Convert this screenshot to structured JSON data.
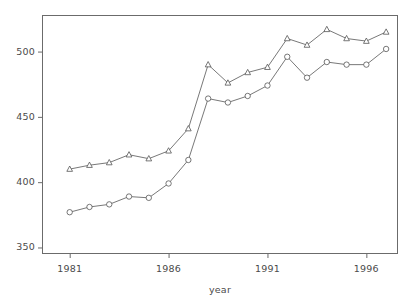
{
  "chart_data": {
    "type": "line",
    "title": "",
    "subtitle": "",
    "xlabel": "year",
    "ylabel": "",
    "xlim": [
      1979.6,
      1997.6
    ],
    "ylim": [
      345,
      528
    ],
    "grid": false,
    "legend": "none",
    "x": [
      1981,
      1982,
      1983,
      1984,
      1985,
      1986,
      1987,
      1988,
      1989,
      1990,
      1991,
      1992,
      1993,
      1994,
      1995,
      1996,
      1997
    ],
    "xticks": [
      1981,
      1986,
      1991,
      1996
    ],
    "xtick_labels": [
      "1981",
      "1986",
      "1991",
      "1996"
    ],
    "yticks": [
      350,
      400,
      450,
      500
    ],
    "ytick_labels": [
      "350",
      "400",
      "450",
      "500"
    ],
    "series": [
      {
        "name": "upper",
        "marker": "triangle",
        "color": "#555555",
        "values": [
          410,
          413,
          415,
          421,
          418,
          424,
          441,
          490,
          476,
          484,
          488,
          510,
          505,
          517,
          510,
          508,
          515
        ]
      },
      {
        "name": "lower",
        "marker": "circle",
        "color": "#555555",
        "values": [
          377,
          381,
          383,
          389,
          388,
          399,
          417,
          464,
          461,
          466,
          474,
          496,
          480,
          492,
          490,
          490,
          502
        ]
      }
    ],
    "axis_color": "#6b6b6b",
    "line_color": "#555555"
  },
  "layout": {
    "plot_left": 42,
    "plot_right": 398,
    "plot_top": 15,
    "plot_bottom": 254
  }
}
